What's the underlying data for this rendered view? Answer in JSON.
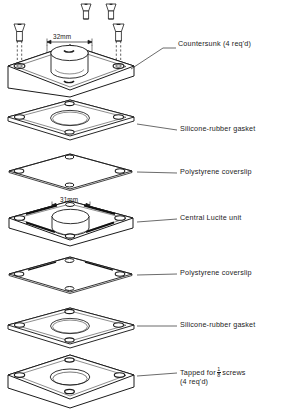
{
  "figure": {
    "projection": "isometric exploded view",
    "line_color": "#1b1b1b",
    "fill_color": "#ffffff"
  },
  "dimensions": [
    {
      "id": "top-plate-bore",
      "value": "32mm",
      "x": 52,
      "y": 33
    },
    {
      "id": "central-unit-bore",
      "value": "31mm",
      "x": 60,
      "y": 196
    }
  ],
  "labels": [
    {
      "id": "countersunk",
      "text": "Countersunk (4 req'd)",
      "x": 180,
      "y": 44,
      "leader_x1": 163,
      "leader_y1": 48,
      "leader_x2": 131,
      "leader_y2": 69
    },
    {
      "id": "gasket-top",
      "text": "Silicone-rubber gasket",
      "x": 180,
      "y": 127,
      "leader_x1": 177,
      "leader_y1": 130,
      "leader_x2": 137,
      "leader_y2": 124
    },
    {
      "id": "coverslip-top",
      "text": "Polystyrene coverslip",
      "x": 180,
      "y": 170,
      "leader_x1": 177,
      "leader_y1": 173,
      "leader_x2": 137,
      "leader_y2": 172
    },
    {
      "id": "central-lucite",
      "text": "Central Lucite unit",
      "x": 180,
      "y": 216,
      "leader_x1": 177,
      "leader_y1": 219,
      "leader_x2": 137,
      "leader_y2": 222
    },
    {
      "id": "coverslip-bottom",
      "text": "Polystyrene coverslip",
      "x": 180,
      "y": 271,
      "leader_x1": 177,
      "leader_y1": 274,
      "leader_x2": 137,
      "leader_y2": 275
    },
    {
      "id": "gasket-bottom",
      "text": "Silicone-rubber gasket",
      "x": 180,
      "y": 323,
      "leader_x1": 177,
      "leader_y1": 326,
      "leader_x2": 137,
      "leader_y2": 326
    },
    {
      "id": "tapped",
      "text_before": "Tapped for",
      "fraction_num": "1",
      "fraction_den": "8",
      "text_after": "screws",
      "text_line2": "(4 req'd)",
      "x": 180,
      "y": 370,
      "leader_x1": 177,
      "leader_y1": 373,
      "leader_x2": 137,
      "leader_y2": 376
    }
  ],
  "layers": [
    {
      "id": "top-plate",
      "name": "Countersunk top plate",
      "center_y": 75,
      "thickness": 14,
      "bore": "deep",
      "holes": 4
    },
    {
      "id": "gasket-1",
      "name": "Silicone-rubber gasket",
      "center_y": 124,
      "thickness": 5,
      "bore": "ring",
      "holes": 4
    },
    {
      "id": "coverslip-1",
      "name": "Polystyrene coverslip",
      "center_y": 172,
      "thickness": 2,
      "bore": "none",
      "holes": 4
    },
    {
      "id": "central-lucite",
      "name": "Central Lucite unit",
      "center_y": 222,
      "thickness": 11,
      "bore": "deep",
      "holes": 4
    },
    {
      "id": "coverslip-2",
      "name": "Polystyrene coverslip",
      "center_y": 275,
      "thickness": 2,
      "bore": "none",
      "holes": 4
    },
    {
      "id": "gasket-2",
      "name": "Silicone-rubber gasket",
      "center_y": 326,
      "thickness": 5,
      "bore": "ring",
      "holes": 4
    },
    {
      "id": "base-plate",
      "name": "Tapped base plate",
      "center_y": 383,
      "thickness": 14,
      "bore": "ring",
      "holes": 4
    }
  ],
  "screws": [
    {
      "id": "screw-back-left",
      "x": 85,
      "y": 6,
      "length": 14,
      "type": "countersunk-flathead"
    },
    {
      "id": "screw-back-right",
      "x": 110,
      "y": 6,
      "length": 14,
      "type": "countersunk-flathead"
    },
    {
      "id": "screw-front-left",
      "x": 20,
      "y": 25,
      "length": 36,
      "type": "countersunk-flathead"
    },
    {
      "id": "screw-front-right",
      "x": 119,
      "y": 25,
      "length": 36,
      "type": "countersunk-flathead"
    }
  ]
}
